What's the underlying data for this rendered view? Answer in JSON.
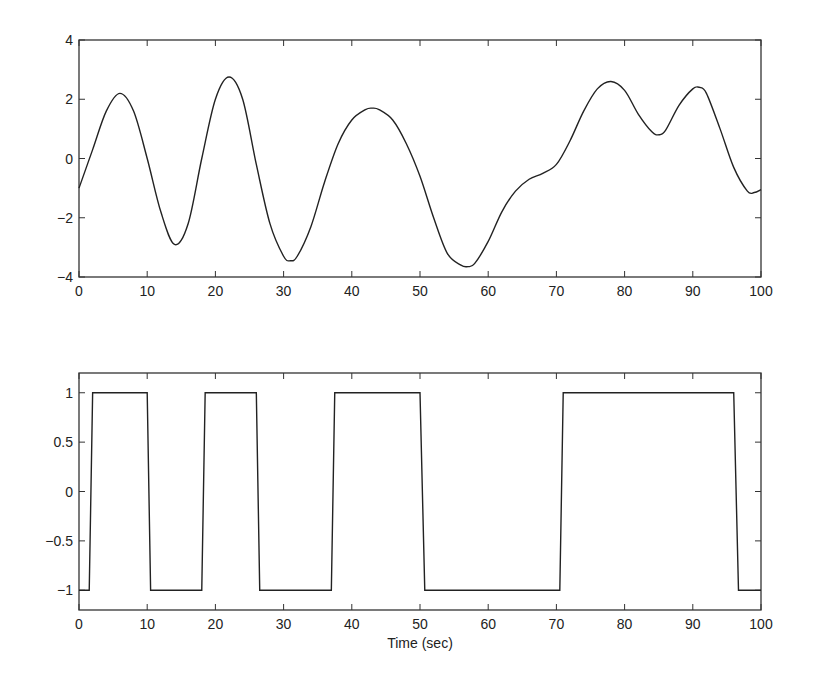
{
  "chart_data": [
    {
      "type": "line",
      "title": "",
      "xlabel": "",
      "ylabel": "",
      "xlim": [
        0,
        100
      ],
      "ylim": [
        -4,
        4
      ],
      "xticks": [
        "0",
        "10",
        "20",
        "30",
        "40",
        "50",
        "60",
        "70",
        "80",
        "90",
        "100"
      ],
      "yticks": [
        "-4",
        "-2",
        "0",
        "2",
        "4"
      ],
      "grid": false,
      "legend": null,
      "series": [
        {
          "name": "signal",
          "x": [
            0,
            2,
            4,
            6,
            8,
            10,
            12,
            14,
            16,
            18,
            20,
            22,
            24,
            26,
            28,
            30,
            31,
            32,
            34,
            36,
            38,
            40,
            42,
            43,
            44,
            46,
            48,
            50,
            52,
            54,
            56,
            57,
            58,
            60,
            62,
            64,
            66,
            68,
            70,
            72,
            74,
            76,
            78,
            80,
            82,
            84,
            85,
            86,
            88,
            90,
            91,
            92,
            94,
            96,
            98,
            99,
            100
          ],
          "y": [
            -1.0,
            0.3,
            1.6,
            2.2,
            1.6,
            0.0,
            -1.8,
            -2.9,
            -2.2,
            0.0,
            2.0,
            2.75,
            2.0,
            -0.2,
            -2.2,
            -3.3,
            -3.45,
            -3.3,
            -2.3,
            -0.8,
            0.5,
            1.3,
            1.65,
            1.7,
            1.65,
            1.3,
            0.5,
            -0.6,
            -2.0,
            -3.2,
            -3.6,
            -3.65,
            -3.55,
            -2.8,
            -1.8,
            -1.1,
            -0.7,
            -0.5,
            -0.2,
            0.6,
            1.6,
            2.35,
            2.6,
            2.3,
            1.5,
            0.9,
            0.8,
            0.95,
            1.8,
            2.35,
            2.4,
            2.2,
            1.0,
            -0.3,
            -1.1,
            -1.15,
            -1.05
          ]
        }
      ]
    },
    {
      "type": "line",
      "title": "",
      "xlabel": "Time (sec)",
      "ylabel": "",
      "xlim": [
        0,
        100
      ],
      "ylim": [
        -1.2,
        1.2
      ],
      "xticks": [
        "0",
        "10",
        "20",
        "30",
        "40",
        "50",
        "60",
        "70",
        "80",
        "90",
        "100"
      ],
      "yticks": [
        "-1",
        "-0.5",
        "0",
        "0.5",
        "1"
      ],
      "grid": false,
      "legend": null,
      "series": [
        {
          "name": "switching",
          "x": [
            0,
            1.5,
            2,
            10,
            10.5,
            18,
            18.5,
            26,
            26.5,
            37,
            37.5,
            50,
            50.7,
            70.5,
            71,
            96,
            96.7,
            100
          ],
          "y": [
            -1,
            -1,
            1,
            1,
            -1,
            -1,
            1,
            1,
            -1,
            -1,
            1,
            1,
            -1,
            -1,
            1,
            1,
            -1,
            -1
          ]
        }
      ]
    }
  ]
}
